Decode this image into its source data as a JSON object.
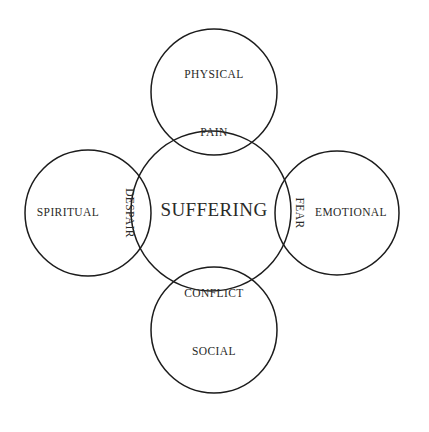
{
  "diagram": {
    "title_text": "SUFFERING",
    "center": {
      "label": "SUFFERING",
      "name": "center-circle-suffering"
    },
    "outer_circles": [
      {
        "label": "PHYSICAL",
        "position": "top"
      },
      {
        "label": "SPIRITUAL",
        "position": "left"
      },
      {
        "label": "EMOTIONAL",
        "position": "right"
      },
      {
        "label": "SOCIAL",
        "position": "bottom"
      }
    ],
    "intersections": [
      {
        "label": "PAIN",
        "position": "top",
        "orientation": "horizontal"
      },
      {
        "label": "DESPAIR",
        "position": "left",
        "orientation": "vertical"
      },
      {
        "label": "FEAR",
        "position": "right",
        "orientation": "vertical"
      },
      {
        "label": "CONFLICT",
        "position": "bottom",
        "orientation": "horizontal"
      }
    ],
    "colors": {
      "background": "#ffffff",
      "stroke": "#1c1c1c",
      "text": "#2a2a28"
    }
  }
}
